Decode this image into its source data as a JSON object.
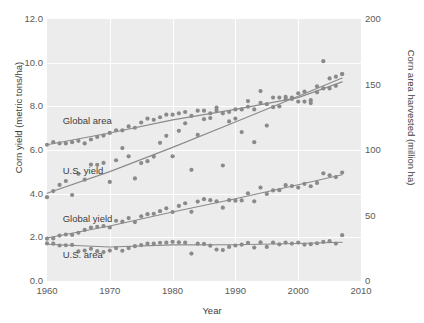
{
  "chart_data": {
    "type": "scatter",
    "title": "",
    "xlabel": "Year",
    "ylabel": "Corn yield (metric tons/ha)",
    "ylabel_right": "Corn area harvested (million ha)",
    "xlim": [
      1960,
      2010
    ],
    "ylim": [
      0.0,
      12.0
    ],
    "ylim_right": [
      0,
      200
    ],
    "xticks": [
      "1960",
      "1970",
      "1980",
      "1990",
      "2000",
      "2010"
    ],
    "xtick_values": [
      1960,
      1970,
      1980,
      1990,
      2000,
      2010
    ],
    "yticks_left": [
      "0.0",
      "2.0",
      "4.0",
      "6.0",
      "8.0",
      "10.0",
      "12.0"
    ],
    "ytick_values_left": [
      0.0,
      2.0,
      4.0,
      6.0,
      8.0,
      10.0,
      12.0
    ],
    "yticks_right": [
      "0",
      "50",
      "100",
      "150",
      "200"
    ],
    "ytick_values_right": [
      0,
      50,
      100,
      150,
      200
    ],
    "grid": true,
    "grid_color": "#ffffff",
    "plot_background": "#ececec",
    "marker_color": "#8a8a8a",
    "trend_color": "#8a8a8a",
    "legend_position": "inline-annotations",
    "annotations": [
      {
        "text": "Global area",
        "x": 1962.5,
        "y": 7.35,
        "axis": "right"
      },
      {
        "text": "U.S. yield",
        "x": 1962.5,
        "y": 5.05,
        "axis": "left"
      },
      {
        "text": "Global yield",
        "x": 1962.5,
        "y": 2.85,
        "axis": "left"
      },
      {
        "text": "U.S. area",
        "x": 1962.5,
        "y": 1.2,
        "axis": "right"
      }
    ],
    "series": [
      {
        "name": "Global area",
        "axis": "right",
        "unit": "million ha",
        "x": [
          1960,
          1961,
          1962,
          1963,
          1964,
          1965,
          1966,
          1967,
          1968,
          1969,
          1970,
          1971,
          1972,
          1973,
          1974,
          1975,
          1976,
          1977,
          1978,
          1979,
          1980,
          1981,
          1982,
          1983,
          1984,
          1985,
          1986,
          1987,
          1988,
          1989,
          1990,
          1991,
          1992,
          1993,
          1994,
          1995,
          1996,
          1997,
          1998,
          1999,
          2000,
          2001,
          2002,
          2003,
          2004,
          2005,
          2006,
          2007
        ],
        "values": [
          104,
          106,
          105,
          105,
          106,
          107,
          105,
          108,
          110,
          111,
          113,
          115,
          115,
          118,
          117,
          121,
          124,
          123,
          125,
          127,
          127,
          128,
          129,
          126,
          130,
          130,
          128,
          130,
          128,
          129,
          131,
          131,
          133,
          131,
          136,
          135,
          140,
          140,
          139,
          139,
          137,
          137,
          138,
          144,
          147,
          147,
          149,
          158
        ]
      },
      {
        "name": "U.S. yield",
        "axis": "left",
        "unit": "metric tons/ha",
        "x": [
          1960,
          1961,
          1962,
          1963,
          1964,
          1965,
          1966,
          1967,
          1968,
          1969,
          1970,
          1971,
          1972,
          1973,
          1974,
          1975,
          1976,
          1977,
          1978,
          1979,
          1980,
          1981,
          1982,
          1983,
          1984,
          1985,
          1986,
          1987,
          1988,
          1989,
          1990,
          1991,
          1992,
          1993,
          1994,
          1995,
          1996,
          1997,
          1998,
          1999,
          2000,
          2001,
          2002,
          2003,
          2004,
          2005,
          2006,
          2007
        ],
        "values": [
          3.84,
          4.12,
          4.4,
          4.58,
          3.94,
          4.91,
          4.64,
          5.33,
          5.32,
          5.41,
          4.54,
          5.53,
          6.09,
          5.71,
          4.7,
          5.4,
          5.49,
          5.7,
          6.33,
          6.65,
          5.71,
          6.88,
          7.22,
          5.09,
          6.69,
          7.41,
          7.46,
          7.94,
          5.29,
          7.31,
          7.44,
          6.82,
          8.24,
          6.36,
          8.7,
          7.12,
          7.96,
          8.0,
          8.43,
          8.4,
          8.6,
          8.67,
          8.15,
          8.92,
          10.07,
          9.28,
          9.36,
          9.48
        ]
      },
      {
        "name": "Global yield",
        "axis": "left",
        "unit": "metric tons/ha",
        "x": [
          1960,
          1961,
          1962,
          1963,
          1964,
          1965,
          1966,
          1967,
          1968,
          1969,
          1970,
          1971,
          1972,
          1973,
          1974,
          1975,
          1976,
          1977,
          1978,
          1979,
          1980,
          1981,
          1982,
          1983,
          1984,
          1985,
          1986,
          1987,
          1988,
          1989,
          1990,
          1991,
          1992,
          1993,
          1994,
          1995,
          1996,
          1997,
          1998,
          1999,
          2000,
          2001,
          2002,
          2003,
          2004,
          2005,
          2006,
          2007
        ],
        "values": [
          1.94,
          1.95,
          2.08,
          2.13,
          2.11,
          2.21,
          2.34,
          2.45,
          2.48,
          2.52,
          2.45,
          2.76,
          2.72,
          2.88,
          2.7,
          2.96,
          3.06,
          3.08,
          3.2,
          3.33,
          3.16,
          3.44,
          3.56,
          3.17,
          3.64,
          3.75,
          3.7,
          3.65,
          3.36,
          3.7,
          3.68,
          3.69,
          4.02,
          3.65,
          4.28,
          3.99,
          4.15,
          4.16,
          4.39,
          4.35,
          4.28,
          4.45,
          4.34,
          4.49,
          4.93,
          4.84,
          4.76,
          4.97
        ]
      },
      {
        "name": "U.S. area",
        "axis": "right",
        "unit": "million ha",
        "x": [
          1960,
          1961,
          1962,
          1963,
          1964,
          1965,
          1966,
          1967,
          1968,
          1969,
          1970,
          1971,
          1972,
          1973,
          1974,
          1975,
          1976,
          1977,
          1978,
          1979,
          1980,
          1981,
          1982,
          1983,
          1984,
          1985,
          1986,
          1987,
          1988,
          1989,
          1990,
          1991,
          1992,
          1993,
          1994,
          1995,
          1996,
          1997,
          1998,
          1999,
          2000,
          2001,
          2002,
          2003,
          2004,
          2005,
          2006,
          2007
        ],
        "values": [
          28.7,
          28.5,
          27.1,
          27.3,
          27.5,
          22.6,
          23.2,
          24.6,
          22.8,
          22.1,
          23.2,
          25.1,
          23.1,
          25.1,
          26.6,
          27.4,
          28.5,
          28.6,
          29.2,
          29.3,
          29.9,
          29.5,
          29.3,
          20.9,
          28.5,
          28.3,
          27.0,
          24.0,
          23.6,
          26.0,
          27.1,
          27.7,
          29.2,
          25.5,
          29.5,
          26.0,
          29.4,
          28.0,
          29.3,
          28.6,
          29.3,
          27.8,
          28.1,
          28.8,
          29.8,
          30.4,
          28.6,
          35.0
        ]
      }
    ],
    "trendlines": [
      {
        "name": "Global area trend",
        "axis": "right",
        "x": [
          1960,
          1970,
          1980,
          1990,
          2000,
          2007
        ],
        "values": [
          104,
          113,
          123,
          131,
          140,
          152
        ]
      },
      {
        "name": "U.S. yield trend",
        "axis": "left",
        "x": [
          1960,
          1970,
          1980,
          1990,
          2000,
          2007
        ],
        "values": [
          4.02,
          5.01,
          6.12,
          7.28,
          8.46,
          9.3
        ]
      },
      {
        "name": "Global yield trend",
        "axis": "left",
        "x": [
          1960,
          1970,
          1980,
          1990,
          2000,
          2007
        ],
        "values": [
          1.97,
          2.52,
          3.16,
          3.77,
          4.41,
          4.87
        ]
      },
      {
        "name": "U.S. area trend",
        "axis": "right",
        "x": [
          1960,
          1970,
          1980,
          1990,
          2000,
          2007
        ],
        "values": [
          28.0,
          26.0,
          27.6,
          27.7,
          28.6,
          29.6
        ]
      }
    ]
  }
}
